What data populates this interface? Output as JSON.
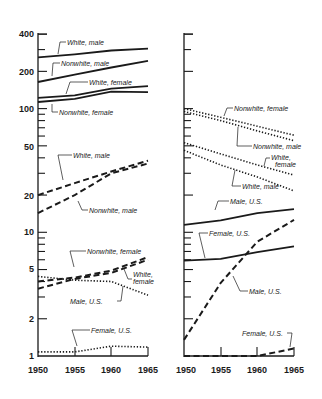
{
  "colors": {
    "ink": "#1a1a1a",
    "background": "#ffffff"
  },
  "chart_data": [
    {
      "type": "line",
      "panel": "left",
      "title": "",
      "xlabel": "",
      "ylabel": "",
      "yscale": "log",
      "ylim": [
        1,
        400
      ],
      "xlim": [
        1950,
        1965
      ],
      "x_ticks": [
        "1950",
        "1955",
        "1960",
        "1965"
      ],
      "y_ticks": [
        "1",
        "2",
        "5",
        "10",
        "20",
        "50",
        "100",
        "200",
        "400"
      ],
      "grid": false,
      "x": [
        1950,
        1955,
        1960,
        1965
      ],
      "series": [
        {
          "name": "White, male",
          "style": "solid",
          "values": [
            260,
            275,
            295,
            305
          ]
        },
        {
          "name": "Nonwhite, male",
          "style": "solid",
          "values": [
            164,
            188,
            215,
            243
          ]
        },
        {
          "name": "White, female",
          "style": "solid",
          "values": [
            122,
            128,
            145,
            152
          ]
        },
        {
          "name": "Nonwhite, female",
          "style": "solid",
          "values": [
            113,
            120,
            137,
            136
          ]
        },
        {
          "name": "White, male",
          "style": "dashed",
          "values": [
            20,
            25,
            31,
            38
          ]
        },
        {
          "name": "Nonwhite, male",
          "style": "dashed",
          "values": [
            14.3,
            20,
            30,
            36
          ]
        },
        {
          "name": "Nonwhite, female",
          "style": "dashed",
          "values": [
            4.0,
            4.3,
            4.9,
            6.3
          ]
        },
        {
          "name": "White, female",
          "style": "dashed",
          "values": [
            3.5,
            4.2,
            4.7,
            6.0
          ]
        },
        {
          "name": "Male, U.S.",
          "style": "dotted",
          "values": [
            4.4,
            4.1,
            4.0,
            3.1
          ]
        },
        {
          "name": "Female, U.S.",
          "style": "dotted",
          "values": [
            1.08,
            1.08,
            1.2,
            1.18
          ]
        }
      ]
    },
    {
      "type": "line",
      "panel": "right",
      "title": "",
      "xlabel": "",
      "ylabel": "",
      "yscale": "log",
      "ylim": [
        1,
        400
      ],
      "xlim": [
        1950,
        1965
      ],
      "x_ticks": [
        "1950",
        "1955",
        "1960",
        "1965"
      ],
      "grid": false,
      "x": [
        1950,
        1955,
        1960,
        1965
      ],
      "series": [
        {
          "name": "Nonwhite, female",
          "style": "dotted",
          "values": [
            100,
            85,
            72,
            61
          ]
        },
        {
          "name": "Nonwhite, male",
          "style": "dotted",
          "values": [
            95,
            80,
            66,
            55
          ]
        },
        {
          "name": "White, female",
          "style": "dotted",
          "values": [
            53,
            43,
            35,
            29
          ]
        },
        {
          "name": "White, male",
          "style": "dotted",
          "values": [
            46,
            35,
            28,
            21.6
          ]
        },
        {
          "name": "Male, U.S.",
          "style": "solid",
          "values": [
            11.5,
            12.5,
            14.3,
            15.4
          ]
        },
        {
          "name": "Female, U.S.",
          "style": "solid",
          "values": [
            5.9,
            6.1,
            6.9,
            7.7
          ]
        },
        {
          "name": "Male, U.S.",
          "style": "dashed",
          "values": [
            1.35,
            3.9,
            8.4,
            12.6
          ]
        },
        {
          "name": "Female, U.S.",
          "style": "dashed",
          "values": [
            1.0,
            1.0,
            1.0,
            1.15
          ]
        }
      ]
    }
  ],
  "labels": {
    "left": {
      "white_male_solid": "White, male",
      "nonwhite_male_solid": "Nonwhite, male",
      "white_female_solid": "White, female",
      "nonwhite_female_solid": "Nonwhite, female",
      "white_male_dashed": "White, male",
      "nonwhite_male_dashed": "Nonwhite, male",
      "nonwhite_female_dashed": "Nonwhite, female",
      "white_female_dashed_1": "White,",
      "white_female_dashed_2": "female",
      "male_us_dotted": "Male, U.S.",
      "female_us_dotted": "Female, U.S."
    },
    "right": {
      "nonwhite_female": "Nonwhite, female",
      "nonwhite_male": "Nonwhite, male",
      "white_female_1": "White,",
      "white_female_2": "female",
      "white_male": "White, male",
      "male_us_solid": "Male, U.S.",
      "female_us_solid": "Female, U.S.",
      "male_us_dashed": "Male, U.S.",
      "female_us_dashed": "Female, U.S."
    }
  },
  "axis": {
    "y_ticks": [
      "400",
      "200",
      "100",
      "50",
      "20",
      "10",
      "5",
      "2",
      "1"
    ],
    "x_ticks": [
      "1950",
      "1955",
      "1960",
      "1965"
    ]
  }
}
